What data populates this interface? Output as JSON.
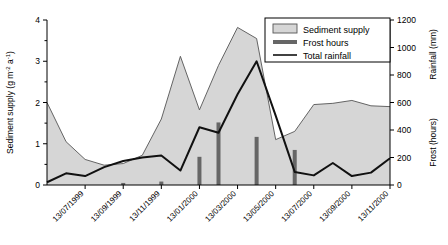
{
  "chart_data": {
    "type": "area",
    "title": "",
    "xlabel": "",
    "ylabel": "Sediment supply (g m-2 a-1)",
    "y2label_top": "Rainfall (mm)",
    "y2label_bottom": "Frost (hours)",
    "ylim": [
      0,
      4
    ],
    "y2lim": [
      0,
      1200
    ],
    "yticks": [
      "0",
      "1",
      "2",
      "3",
      "4"
    ],
    "ytick_values": [
      0,
      1,
      2,
      3,
      4
    ],
    "y2ticks": [
      "0",
      "200",
      "400",
      "600",
      "800",
      "1000",
      "1200"
    ],
    "y2tick_values": [
      0,
      200,
      400,
      600,
      800,
      1000,
      1200
    ],
    "grid": false,
    "legend_position": "top-right",
    "xticklabels": [
      "13/07/1999",
      "13/09/1999",
      "13/11/1999",
      "13/01/2000",
      "13/03/2000",
      "13/05/2000",
      "13/07/2000",
      "13/09/2000",
      "13/11/2000"
    ],
    "x": [
      "13/05/1999",
      "13/06/1999",
      "13/07/1999",
      "13/08/1999",
      "13/09/1999",
      "13/10/1999",
      "13/11/1999",
      "13/12/1999",
      "13/01/2000",
      "13/02/2000",
      "13/03/2000",
      "13/04/2000",
      "13/05/2000",
      "13/06/2000",
      "13/07/2000",
      "13/08/2000",
      "13/09/2000",
      "13/10/2000",
      "13/11/2000"
    ],
    "series": [
      {
        "name": "Sediment supply",
        "type": "area",
        "unit": "g m-2 a-1",
        "axis": "left",
        "color": "#d6d6d6",
        "edgecolor": "#555555",
        "values": [
          2.0,
          1.05,
          0.62,
          0.48,
          0.52,
          0.72,
          1.6,
          3.12,
          1.82,
          2.9,
          3.82,
          3.55,
          1.1,
          1.3,
          1.95,
          1.98,
          2.05,
          1.92,
          1.9
        ]
      },
      {
        "name": "Frost hours",
        "type": "bar",
        "unit": "hours",
        "axis": "right",
        "color": "#666666",
        "values": [
          0,
          0,
          0,
          0,
          15,
          0,
          25,
          0,
          205,
          455,
          0,
          350,
          0,
          255,
          0,
          0,
          0,
          0,
          0
        ]
      },
      {
        "name": "Total rainfall",
        "type": "line",
        "unit": "mm",
        "axis": "right",
        "color": "#111111",
        "values": [
          20,
          85,
          65,
          130,
          175,
          200,
          215,
          105,
          420,
          380,
          660,
          900,
          505,
          95,
          70,
          160,
          65,
          90,
          195
        ]
      }
    ]
  },
  "legend": {
    "items": [
      {
        "label": "Sediment supply",
        "marker": "swatch"
      },
      {
        "label": "Frost hours",
        "marker": "thick-bar"
      },
      {
        "label": "Total rainfall",
        "marker": "thin-line"
      }
    ]
  },
  "colors": {
    "area_fill": "#d6d6d6",
    "area_edge": "#555555",
    "bar": "#666666",
    "line": "#111111",
    "axis": "#000000"
  }
}
